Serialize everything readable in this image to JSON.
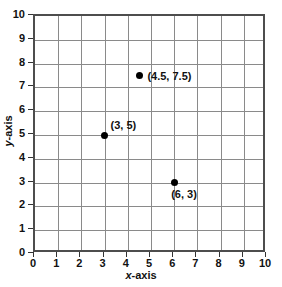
{
  "chart_data": {
    "type": "scatter",
    "title": "",
    "xlabel": "x-axis",
    "ylabel": "y-axis",
    "xlabel_italic_prefix": "x",
    "xlabel_suffix": "-axis",
    "ylabel_italic_prefix": "y",
    "ylabel_suffix": "-axis",
    "xlim": [
      0,
      10
    ],
    "ylim": [
      0,
      10
    ],
    "xticks": [
      "0",
      "1",
      "2",
      "3",
      "4",
      "5",
      "6",
      "7",
      "8",
      "9",
      "10"
    ],
    "yticks": [
      "0",
      "1",
      "2",
      "3",
      "4",
      "5",
      "6",
      "7",
      "8",
      "9",
      "10"
    ],
    "xtick_values": [
      0,
      1,
      2,
      3,
      4,
      5,
      6,
      7,
      8,
      9,
      10
    ],
    "ytick_values": [
      0,
      1,
      2,
      3,
      4,
      5,
      6,
      7,
      8,
      9,
      10
    ],
    "grid": true,
    "grid_color": "#8a8a8a",
    "frame_color": "#4d4d4d",
    "background": "#ffffff",
    "marker_color": "#000000",
    "legend": null,
    "points": [
      {
        "x": 3,
        "y": 5,
        "label": "(3, 5)",
        "label_position": "above-right",
        "label_dx": 6,
        "label_dy": -16
      },
      {
        "x": 4.5,
        "y": 7.5,
        "label": "(4.5, 7.5)",
        "label_position": "right",
        "label_dx": 8,
        "label_dy": -6
      },
      {
        "x": 6,
        "y": 3,
        "label": "(6, 3)",
        "label_position": "below-right",
        "label_dx": -3,
        "label_dy": 5
      }
    ]
  }
}
